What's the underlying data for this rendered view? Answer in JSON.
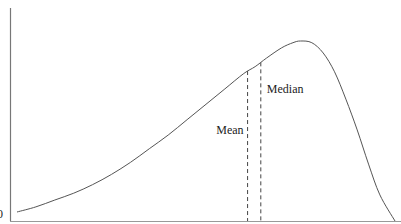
{
  "chart_data": {
    "type": "line",
    "title": "",
    "xlabel": "",
    "ylabel": "",
    "y_tick_labels": [
      "0"
    ],
    "curve_points": [
      [
        0.0,
        0.0
      ],
      [
        0.05,
        0.03
      ],
      [
        0.1,
        0.07
      ],
      [
        0.15,
        0.11
      ],
      [
        0.2,
        0.16
      ],
      [
        0.25,
        0.22
      ],
      [
        0.3,
        0.29
      ],
      [
        0.35,
        0.37
      ],
      [
        0.4,
        0.45
      ],
      [
        0.45,
        0.54
      ],
      [
        0.5,
        0.63
      ],
      [
        0.55,
        0.72
      ],
      [
        0.6,
        0.81
      ],
      [
        0.63,
        0.85
      ],
      [
        0.66,
        0.9
      ],
      [
        0.7,
        0.96
      ],
      [
        0.73,
        0.99
      ],
      [
        0.75,
        1.0
      ],
      [
        0.78,
        0.99
      ],
      [
        0.81,
        0.93
      ],
      [
        0.84,
        0.82
      ],
      [
        0.87,
        0.66
      ],
      [
        0.9,
        0.48
      ],
      [
        0.93,
        0.28
      ],
      [
        0.96,
        0.1
      ],
      [
        1.0,
        0.0
      ]
    ],
    "markers": [
      {
        "name": "Mean",
        "x": 0.61
      },
      {
        "name": "Median",
        "x": 0.645
      }
    ],
    "grid": false
  }
}
